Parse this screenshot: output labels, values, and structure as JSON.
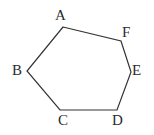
{
  "figure": {
    "name": "hexagon-abcdef",
    "background_color": "#ffffff",
    "stroke_color": "#333333",
    "label_color": "#2b2b2b",
    "stroke_width": 1.2,
    "canvas": {
      "width": 154,
      "height": 135
    },
    "shape": {
      "type": "polygon",
      "closed": true,
      "vertex_count": 6,
      "points": "63,27 121,41 131,72 117,110 60,110 27,71"
    },
    "vertices": [
      {
        "id": "A",
        "label": "A",
        "x": 63,
        "y": 27,
        "label_x": 55,
        "label_y": 8
      },
      {
        "id": "F",
        "label": "F",
        "x": 121,
        "y": 41,
        "label_x": 122,
        "label_y": 25
      },
      {
        "id": "E",
        "label": "E",
        "x": 131,
        "y": 72,
        "label_x": 132,
        "label_y": 63
      },
      {
        "id": "D",
        "label": "D",
        "x": 117,
        "y": 110,
        "label_x": 112,
        "label_y": 113
      },
      {
        "id": "C",
        "label": "C",
        "x": 60,
        "y": 110,
        "label_x": 58,
        "label_y": 113
      },
      {
        "id": "B",
        "label": "B",
        "x": 27,
        "y": 71,
        "label_x": 12,
        "label_y": 63
      }
    ],
    "edges": [
      {
        "id": "AB",
        "from": "A",
        "to": "B"
      },
      {
        "id": "BC",
        "from": "B",
        "to": "C"
      },
      {
        "id": "CD",
        "from": "C",
        "to": "D"
      },
      {
        "id": "DE",
        "from": "D",
        "to": "E"
      },
      {
        "id": "EF",
        "from": "E",
        "to": "F"
      },
      {
        "id": "FA",
        "from": "F",
        "to": "A"
      }
    ]
  }
}
